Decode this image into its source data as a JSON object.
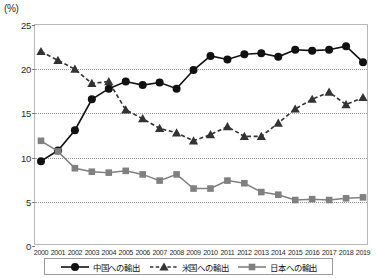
{
  "axis": {
    "unit_label": "(%)",
    "y_ticks": [
      0,
      5,
      10,
      15,
      20,
      25
    ],
    "x_ticks": [
      "2000",
      "2001",
      "2002",
      "2003",
      "2004",
      "2005",
      "2006",
      "2007",
      "2008",
      "2009",
      "2010",
      "2011",
      "2012",
      "2013",
      "2014",
      "2015",
      "2016",
      "2017",
      "2018",
      "2019"
    ]
  },
  "legend": {
    "items": [
      {
        "label": "中国への輸出",
        "marker": "filled-circle-solid-line",
        "color": "#111111"
      },
      {
        "label": "米国への輸出",
        "marker": "filled-triangle-dashed-line",
        "color": "#333333"
      },
      {
        "label": "日本への輸出",
        "marker": "filled-square-solid-line",
        "color": "#808080"
      }
    ]
  },
  "chart_data": {
    "type": "line",
    "title": "",
    "subtitle": "",
    "xlabel": "",
    "ylabel": "(%)",
    "ylim": [
      0,
      25
    ],
    "grid": true,
    "legend_position": "bottom",
    "x": [
      "2000",
      "2001",
      "2002",
      "2003",
      "2004",
      "2005",
      "2006",
      "2007",
      "2008",
      "2009",
      "2010",
      "2011",
      "2012",
      "2013",
      "2014",
      "2015",
      "2016",
      "2017",
      "2018",
      "2019"
    ],
    "series": [
      {
        "name": "中国への輸出",
        "name_en": "Exports to China",
        "marker": "circle",
        "linestyle": "solid",
        "color": "#111111",
        "values": [
          9.6,
          10.8,
          13.1,
          16.6,
          17.8,
          18.6,
          18.2,
          18.5,
          17.8,
          19.9,
          21.5,
          21.1,
          21.7,
          21.8,
          21.4,
          22.2,
          22.1,
          22.2,
          22.6,
          20.8
        ]
      },
      {
        "name": "米国への輸出",
        "name_en": "Exports to the United States",
        "marker": "triangle",
        "linestyle": "dashed",
        "color": "#333333",
        "values": [
          22.0,
          21.0,
          20.0,
          18.4,
          18.6,
          15.4,
          14.4,
          13.3,
          12.8,
          11.9,
          12.6,
          13.5,
          12.4,
          12.4,
          13.9,
          15.5,
          16.6,
          17.4,
          16.0,
          16.8
        ]
      },
      {
        "name": "日本への輸出",
        "name_en": "Exports to Japan",
        "marker": "square",
        "linestyle": "solid",
        "color": "#808080",
        "values": [
          11.9,
          10.7,
          8.8,
          8.4,
          8.3,
          8.5,
          8.1,
          7.4,
          8.1,
          6.5,
          6.5,
          7.4,
          7.1,
          6.1,
          5.8,
          5.2,
          5.3,
          5.2,
          5.4,
          5.5
        ]
      }
    ]
  }
}
